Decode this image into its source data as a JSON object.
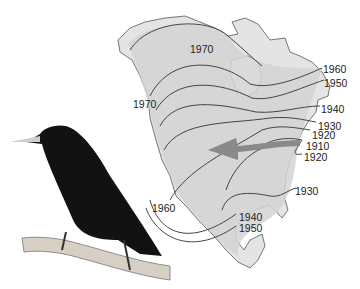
{
  "figure": {
    "arrow_direction": "east-to-west",
    "colors": {
      "land": "#e4e4e4",
      "range": "#d2d2d2",
      "outline": "#444444",
      "arrow": "#8a8a8a",
      "bird": "#111111",
      "branch": "#cfc8bd"
    }
  },
  "labels": [
    {
      "text": "1970",
      "x": 190,
      "y": 50
    },
    {
      "text": "1960",
      "x": 323,
      "y": 67
    },
    {
      "text": "1950",
      "x": 324,
      "y": 79
    },
    {
      "text": "1970",
      "x": 133,
      "y": 101
    },
    {
      "text": "1940",
      "x": 321,
      "y": 105
    },
    {
      "text": "1930",
      "x": 318,
      "y": 121
    },
    {
      "text": "1920",
      "x": 312,
      "y": 130
    },
    {
      "text": "1910",
      "x": 306,
      "y": 141
    },
    {
      "text": "1920",
      "x": 304,
      "y": 152
    },
    {
      "text": "1930",
      "x": 295,
      "y": 186
    },
    {
      "text": "1960",
      "x": 152,
      "y": 203
    },
    {
      "text": "1940",
      "x": 239,
      "y": 214
    },
    {
      "text": "1950",
      "x": 239,
      "y": 224
    }
  ]
}
